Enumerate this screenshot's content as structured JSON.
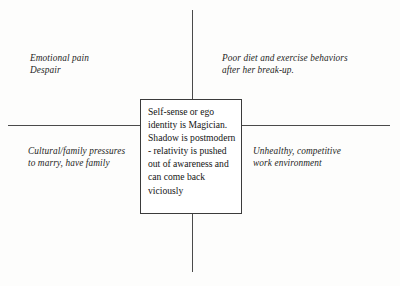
{
  "diagram": {
    "type": "four-quadrant-diagram",
    "center_box": {
      "text": "Self-sense or ego identity is Magician. Shadow is postmodern - relativity is pushed out of awareness and can come back viciously"
    },
    "quadrants": [
      {
        "position": "top-left",
        "text": "Emotional pain\nDespair"
      },
      {
        "position": "top-right",
        "text": "Poor diet and exercise behaviors\nafter her break-up."
      },
      {
        "position": "bottom-left",
        "text": "Cultural/family pressures\nto marry, have family"
      },
      {
        "position": "bottom-right",
        "text": "Unhealthy, competitive\nwork environment"
      }
    ],
    "axes": {
      "horizontal_line_color": "#4a4a4a",
      "vertical_line_color": "#4a4a4a"
    },
    "colors": {
      "background": "#fdfdfc",
      "text": "#191919",
      "box_border": "#3b3b3b",
      "box_fill": "#ffffff"
    }
  }
}
